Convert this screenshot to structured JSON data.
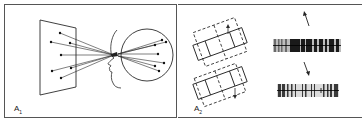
{
  "figure": {
    "colors": {
      "background": "#ffffff",
      "stroke": "#2a2a2a",
      "frame": "#555555",
      "stripes_dark": "#1a1a1a",
      "stripes_mid": "#6a6a6a"
    },
    "panels": [
      {
        "id": "A1",
        "label_main": "A",
        "label_sub": "1",
        "description": "Points on a tilted plane projected through the eye onto a spherical retina"
      },
      {
        "id": "A2",
        "label_main": "A",
        "label_sub": "2",
        "description": "Two overlapping rectangular grids with arrows and corresponding striped patterns"
      }
    ]
  }
}
